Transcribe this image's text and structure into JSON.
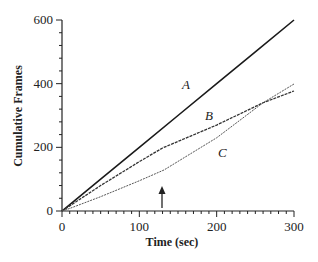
{
  "chart_data": {
    "type": "line",
    "title": "",
    "xlabel": "Time (sec)",
    "ylabel": "Cumulative Frames",
    "xlim": [
      0,
      300
    ],
    "ylim": [
      0,
      600
    ],
    "xticks": [
      0,
      100,
      200,
      300
    ],
    "yticks": [
      0,
      200,
      400,
      600
    ],
    "grid": false,
    "legend": "inline labels",
    "series": [
      {
        "name": "A",
        "x": [
          0,
          5,
          50,
          100,
          150,
          200,
          250,
          300
        ],
        "y": [
          0,
          10,
          100,
          200,
          300,
          400,
          500,
          600
        ]
      },
      {
        "name": "B",
        "x": [
          0,
          5,
          50,
          100,
          130,
          200,
          260,
          300
        ],
        "y": [
          0,
          8,
          80,
          155,
          198,
          270,
          340,
          377
        ]
      },
      {
        "name": "C",
        "x": [
          0,
          10,
          50,
          100,
          132,
          200,
          260,
          300
        ],
        "y": [
          0,
          8,
          45,
          95,
          129,
          230,
          340,
          399
        ]
      }
    ],
    "annotations": [
      {
        "type": "arrow",
        "x": 130,
        "label": "upward arrow marking change point"
      }
    ],
    "labels": {
      "A": "A",
      "B": "B",
      "C": "C"
    }
  }
}
